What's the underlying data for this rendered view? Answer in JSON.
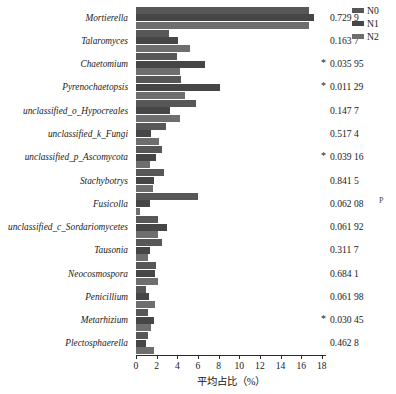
{
  "chart_data": {
    "type": "bar",
    "orientation": "horizontal",
    "title": "",
    "xlabel": "平均占比（%）",
    "ylabel": "",
    "xlim": [
      0,
      18.4
    ],
    "xticks": [
      0,
      2,
      4,
      6,
      8,
      10,
      12,
      14,
      16,
      18
    ],
    "grid": false,
    "legend_position": "top-right",
    "categories": [
      "Mortierella",
      "Talaromyces",
      "Chaetomium",
      "Pyrenochaetopsis",
      "unclassified_o_Hypocreales",
      "unclassified_k_Fungi",
      "unclassified_p_Ascomycota",
      "Stachybotrys",
      "Fusicolla",
      "unclassified_c_Sordariomycetes",
      "Tausonia",
      "Neocosmospora",
      "Penicillium",
      "Metarhizium",
      "Plectosphaerella"
    ],
    "series": [
      {
        "name": "N0",
        "color": "#575757",
        "values": [
          16.8,
          3.2,
          4.0,
          4.4,
          5.8,
          2.9,
          2.5,
          2.7,
          6.0,
          2.1,
          2.5,
          1.9,
          1.0,
          1.2,
          1.2
        ]
      },
      {
        "name": "N1",
        "color": "#464646",
        "values": [
          17.2,
          4.1,
          6.7,
          8.1,
          3.3,
          1.5,
          1.9,
          1.7,
          1.4,
          3.0,
          1.4,
          1.8,
          1.3,
          1.7,
          1.0
        ]
      },
      {
        "name": "N2",
        "color": "#6e6e6e",
        "values": [
          16.8,
          5.2,
          4.3,
          4.7,
          4.3,
          2.2,
          1.4,
          1.6,
          0.4,
          2.1,
          1.2,
          2.1,
          1.8,
          1.5,
          1.7
        ]
      }
    ],
    "p_values": [
      {
        "value": "0.729 9",
        "significant": false
      },
      {
        "value": "0.163 7",
        "significant": false
      },
      {
        "value": "0.035 95",
        "significant": true
      },
      {
        "value": "0.011 29",
        "significant": true
      },
      {
        "value": "0.147 7",
        "significant": false
      },
      {
        "value": "0.517 4",
        "significant": false
      },
      {
        "value": "0.039 16",
        "significant": true
      },
      {
        "value": "0.841 5",
        "significant": false
      },
      {
        "value": "0.062 08",
        "significant": false
      },
      {
        "value": "0.061 92",
        "significant": false
      },
      {
        "value": "0.311 7",
        "significant": false
      },
      {
        "value": "0.684 1",
        "significant": false
      },
      {
        "value": "0.061 98",
        "significant": false
      },
      {
        "value": "0.030 45",
        "significant": true
      },
      {
        "value": "0.462 8",
        "significant": false
      }
    ],
    "significance_marker": "*"
  },
  "legend": {
    "items": [
      {
        "label": "N0"
      },
      {
        "label": "N1"
      },
      {
        "label": "N2"
      }
    ]
  },
  "artifacts": {
    "stray_mark": "P"
  }
}
